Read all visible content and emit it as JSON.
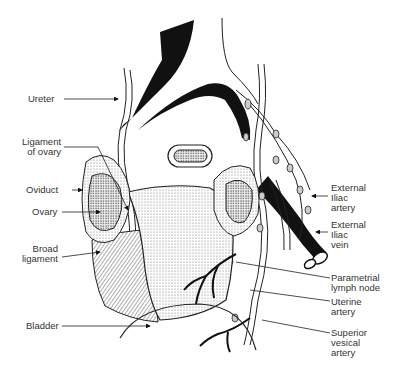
{
  "figure": {
    "colors": {
      "ink": "#111111",
      "background": "#ffffff",
      "stipple": "#bbbbbb"
    }
  },
  "labels_left": [
    {
      "id": "ureter",
      "lines": [
        "Ureter"
      ]
    },
    {
      "id": "ligament-of-ovary",
      "lines": [
        "Ligament",
        "of ovary"
      ]
    },
    {
      "id": "oviduct",
      "lines": [
        "Oviduct"
      ]
    },
    {
      "id": "ovary",
      "lines": [
        "Ovary"
      ]
    },
    {
      "id": "broad-ligament",
      "lines": [
        "Broad",
        "ligament"
      ]
    },
    {
      "id": "bladder",
      "lines": [
        "Bladder"
      ]
    }
  ],
  "labels_right": [
    {
      "id": "external-iliac-artery",
      "lines": [
        "External",
        "Iliac",
        "artery"
      ]
    },
    {
      "id": "external-iliac-vein",
      "lines": [
        "External",
        "Iliac",
        "vein"
      ]
    },
    {
      "id": "parametrial-lymph-node",
      "lines": [
        "Parametrial",
        "lymph node"
      ]
    },
    {
      "id": "uterine-artery",
      "lines": [
        "Uterine",
        "artery"
      ]
    },
    {
      "id": "superior-vesical-artery",
      "lines": [
        "Superior",
        "vesical",
        "artery"
      ]
    }
  ]
}
